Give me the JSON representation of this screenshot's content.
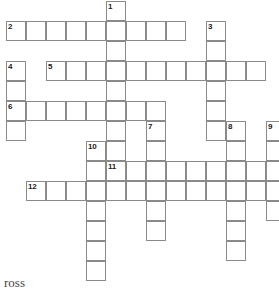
{
  "puzzle": {
    "title": "Crossword grid",
    "cell_size": 20,
    "grid_origin": {
      "x": 6,
      "y": 1
    },
    "colors": {
      "cell_border": "#8a8a8a",
      "cell_fill": "#ffffff",
      "number_text": "#1a1a1a",
      "page_background": "#ffffff"
    },
    "footer_label": "ross",
    "entries": [
      {
        "number": "1",
        "direction": "down",
        "col": 5,
        "row": 0,
        "length": 9
      },
      {
        "number": "2",
        "direction": "across",
        "col": 0,
        "row": 1,
        "length": 9
      },
      {
        "number": "3",
        "direction": "down",
        "col": 10,
        "row": 1,
        "length": 6
      },
      {
        "number": "4",
        "direction": "down",
        "col": 0,
        "row": 3,
        "length": 4
      },
      {
        "number": "5",
        "direction": "across",
        "col": 2,
        "row": 3,
        "length": 11
      },
      {
        "number": "6",
        "direction": "across",
        "col": 0,
        "row": 5,
        "length": 8
      },
      {
        "number": "7",
        "direction": "down",
        "col": 7,
        "row": 6,
        "length": 6
      },
      {
        "number": "8",
        "direction": "down",
        "col": 11,
        "row": 6,
        "length": 7
      },
      {
        "number": "9",
        "direction": "down",
        "col": 13,
        "row": 6,
        "length": 5
      },
      {
        "number": "10",
        "direction": "down",
        "col": 4,
        "row": 7,
        "length": 7
      },
      {
        "number": "11",
        "direction": "across",
        "col": 5,
        "row": 8,
        "length": 8
      },
      {
        "number": "12",
        "direction": "across",
        "col": 1,
        "row": 9,
        "length": 13
      }
    ],
    "numbered_cells": [
      {
        "number": "1",
        "col": 5,
        "row": 0
      },
      {
        "number": "2",
        "col": 0,
        "row": 1
      },
      {
        "number": "3",
        "col": 10,
        "row": 1
      },
      {
        "number": "4",
        "col": 0,
        "row": 3
      },
      {
        "number": "5",
        "col": 2,
        "row": 3
      },
      {
        "number": "6",
        "col": 0,
        "row": 5
      },
      {
        "number": "7",
        "col": 7,
        "row": 6
      },
      {
        "number": "8",
        "col": 11,
        "row": 6
      },
      {
        "number": "9",
        "col": 13,
        "row": 6
      },
      {
        "number": "10",
        "col": 4,
        "row": 7
      },
      {
        "number": "11",
        "col": 5,
        "row": 8
      },
      {
        "number": "12",
        "col": 1,
        "row": 9
      }
    ],
    "cells": []
  }
}
